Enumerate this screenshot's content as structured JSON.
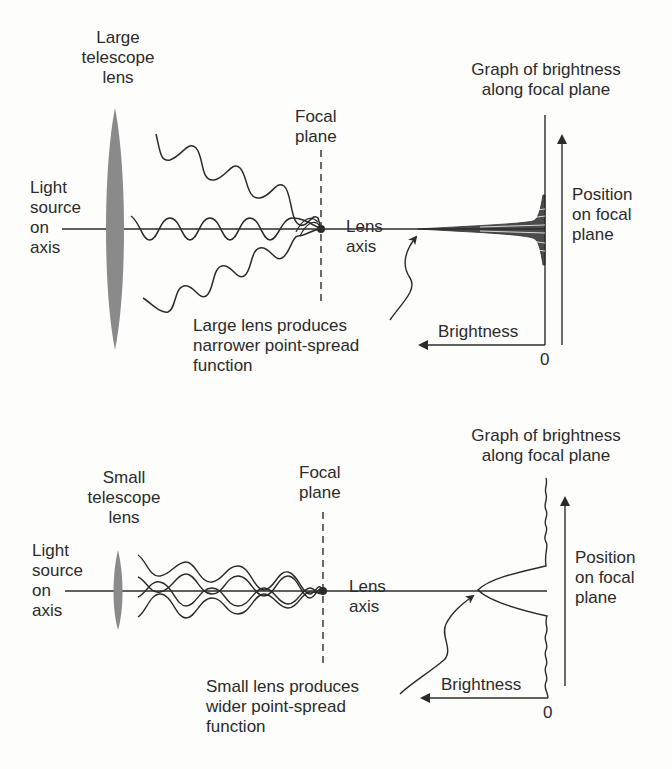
{
  "top_panel": {
    "lens_label": "Large\ntelescope\nlens",
    "source_label": "Light\nsource\non\naxis",
    "focal_plane_label": "Focal\nplane",
    "lens_axis_label": "Lens\naxis",
    "graph_title": "Graph of brightness\nalong focal plane",
    "position_label": "Position\non focal\nplane",
    "brightness_label": "Brightness",
    "zero_label": "0",
    "caption": "Large lens produces\nnarrower point-spread\nfunction"
  },
  "bottom_panel": {
    "lens_label": "Small\ntelescope\nlens",
    "source_label": "Light\nsource\non\naxis",
    "focal_plane_label": "Focal\nplane",
    "lens_axis_label": "Lens\naxis",
    "graph_title": "Graph of brightness\nalong focal plane",
    "position_label": "Position\non focal\nplane",
    "brightness_label": "Brightness",
    "zero_label": "0",
    "caption": "Small lens produces\nwider point-spread\nfunction"
  },
  "colors": {
    "ink": "#2b2b2b",
    "lens_fill": "#8a8a8a",
    "background": "#fdfdfc"
  }
}
